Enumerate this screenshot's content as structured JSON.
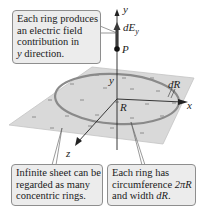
{
  "callouts": {
    "top": {
      "lines": [
        "Each ring produces",
        "an electric field",
        "contribution in"
      ],
      "last_line_italic": "y",
      "last_line_rest": " direction."
    },
    "bottom_left": {
      "lines": [
        "Infinite sheet can be",
        "regarded as many",
        "concentric rings."
      ]
    },
    "bottom_right": {
      "lines": [
        "Each ring has"
      ],
      "line2_text": "circumference ",
      "line2_math": "2πR",
      "line3_text": "and width ",
      "line3_math": "dR",
      "line3_end": "."
    }
  },
  "labels": {
    "y_axis": "y",
    "x_axis": "x",
    "z_axis": "z",
    "field": "dE",
    "field_sub": "y",
    "point": "P",
    "radius": "R",
    "ring_width": "dR",
    "ring_y": "y"
  },
  "colors": {
    "sheet": "#d9d9d9",
    "sheet_edge": "#bdbdbd",
    "ring": "#8a8a8a",
    "callout_bg": "#ececec",
    "callout_border": "#8e8e8e",
    "axis": "#222222",
    "charge_mark": "#8c8c8c"
  }
}
